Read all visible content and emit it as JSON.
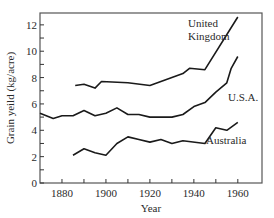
{
  "chart_data": {
    "type": "line",
    "title": "",
    "xlabel": "Year",
    "ylabel": "Grain yeild (kg/acre)",
    "xlim": [
      1870,
      1971
    ],
    "ylim": [
      0,
      12.9
    ],
    "xticks": [
      1870,
      1880,
      1890,
      1900,
      1910,
      1920,
      1930,
      1940,
      1950,
      1960
    ],
    "xtick_labels": [
      "1880",
      "1900",
      "1920",
      "1940",
      "1960"
    ],
    "xtick_label_values": [
      1880,
      1900,
      1920,
      1940,
      1960
    ],
    "yticks": [
      0,
      1,
      2,
      3,
      4,
      5,
      6,
      7,
      8,
      9,
      10,
      11,
      12
    ],
    "ytick_labels": [
      "0",
      "2",
      "4",
      "6",
      "8",
      "10",
      "12"
    ],
    "ytick_label_values": [
      0,
      2,
      4,
      6,
      8,
      10,
      12
    ],
    "grid": false,
    "legend": "inline labels",
    "series": [
      {
        "name": "United Kingdom",
        "label_lines": [
          "United",
          "Kingdom"
        ],
        "x": [
          1886,
          1890,
          1895,
          1898,
          1910,
          1920,
          1930,
          1935,
          1938,
          1945,
          1960
        ],
        "values": [
          7.4,
          7.5,
          7.2,
          7.7,
          7.6,
          7.4,
          8.0,
          8.3,
          8.7,
          8.6,
          12.6
        ]
      },
      {
        "name": "U.S.A.",
        "label_lines": [
          "U.S.A."
        ],
        "x": [
          1870,
          1876,
          1880,
          1885,
          1890,
          1895,
          1900,
          1905,
          1910,
          1915,
          1920,
          1930,
          1935,
          1940,
          1945,
          1950,
          1955,
          1957,
          1960
        ],
        "values": [
          5.3,
          4.9,
          5.1,
          5.1,
          5.5,
          5.1,
          5.3,
          5.7,
          5.2,
          5.2,
          5.0,
          5.0,
          5.2,
          5.8,
          6.1,
          6.9,
          7.6,
          8.7,
          9.6
        ]
      },
      {
        "name": "Australia",
        "label_lines": [
          "Australia"
        ],
        "x": [
          1885,
          1890,
          1895,
          1900,
          1905,
          1910,
          1915,
          1920,
          1925,
          1930,
          1935,
          1945,
          1950,
          1955,
          1960
        ],
        "values": [
          2.1,
          2.6,
          2.3,
          2.1,
          3.0,
          3.5,
          3.3,
          3.1,
          3.3,
          3.0,
          3.2,
          3.0,
          4.2,
          4.0,
          4.6
        ]
      }
    ],
    "line_color": "#1a1a1a"
  }
}
